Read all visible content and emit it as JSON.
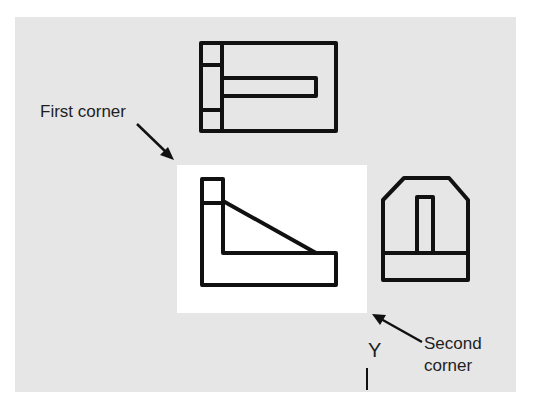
{
  "diagram": {
    "type": "orthographic-views-window-selection",
    "views": [
      {
        "name": "top-view"
      },
      {
        "name": "front-view",
        "selected": true
      },
      {
        "name": "right-side-view"
      }
    ],
    "selection_window": {
      "first_corner_label": "First corner",
      "second_corner_label_line1": "Second",
      "second_corner_label_line2": "corner"
    },
    "ucs_axis_label": "Y",
    "colors": {
      "background_panel": "#e6e6e6",
      "selection_fill": "#ffffff",
      "line": "#111111",
      "text": "#1e1e1e"
    }
  }
}
